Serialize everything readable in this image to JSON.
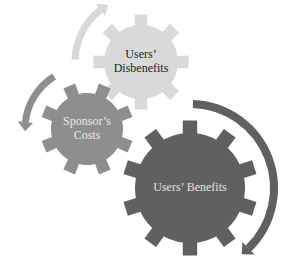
{
  "diagram": {
    "gears": [
      {
        "id": "users-disbenefits",
        "label_lines": [
          "Users’",
          "Disbenefits"
        ],
        "cx": 141,
        "cy": 62,
        "outer_r": 48,
        "inner_r": 37,
        "teeth": 8,
        "rotation": 0,
        "fill": "#d9d9d9",
        "text_color": "#222222",
        "font_size": 12
      },
      {
        "id": "sponsors-costs",
        "label_lines": [
          "Sponsor’s",
          "Costs"
        ],
        "cx": 87,
        "cy": 129,
        "outer_r": 47,
        "inner_r": 36,
        "teeth": 8,
        "rotation": 22.5,
        "fill": "#8e8e8e",
        "text_color": "#e8e8e8",
        "font_size": 12
      },
      {
        "id": "users-benefits",
        "label_lines": [
          "Users’ Benefits"
        ],
        "cx": 190,
        "cy": 188,
        "outer_r": 68,
        "inner_r": 55,
        "teeth": 10,
        "rotation": 0,
        "fill": "#606060",
        "text_color": "#e0e0e0",
        "font_size": 12
      }
    ],
    "arrows": [
      {
        "id": "arrow-light",
        "color": "#d9d9d9",
        "cx": 141,
        "cy": 62,
        "r": 66,
        "start_deg": 182,
        "end_deg": 240,
        "width": 7
      },
      {
        "id": "arrow-medium",
        "color": "#8e8e8e",
        "cx": 87,
        "cy": 129,
        "r": 62,
        "start_deg": 238,
        "end_deg": 178,
        "width": 7
      },
      {
        "id": "arrow-dark",
        "color": "#606060",
        "cx": 190,
        "cy": 188,
        "r": 84,
        "start_deg": 272,
        "end_deg": 412,
        "width": 8
      }
    ]
  }
}
